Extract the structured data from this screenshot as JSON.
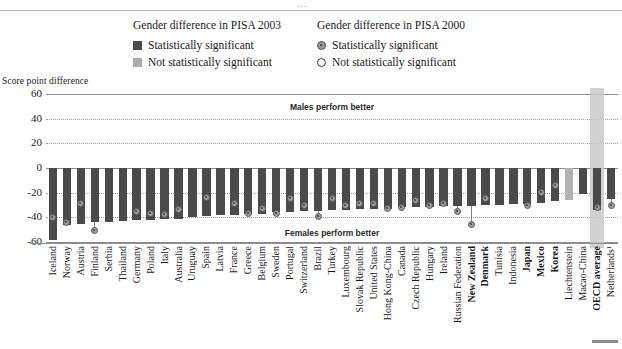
{
  "page": {
    "top_glyph": "…"
  },
  "legend": {
    "columns": [
      {
        "title": "Gender difference in PISA 2003",
        "items": [
          {
            "marker": "dark-square-swatch",
            "label": "Statistically significant"
          },
          {
            "marker": "light-square-swatch",
            "label": "Not statistically significant"
          }
        ]
      },
      {
        "title": "Gender difference in PISA 2000",
        "items": [
          {
            "marker": "filled-circle-marker",
            "label": "Statistically significant"
          },
          {
            "marker": "open-circle-marker",
            "label": "Not statistically significant"
          }
        ]
      }
    ]
  },
  "axis_title": "Score point difference",
  "annotations": {
    "males": "Males perform better",
    "females": "Females perform better"
  },
  "colors": {
    "bar_significant": "#4a4a4a",
    "bar_not_significant": "#b2b2b2",
    "marker_fill": "#9d9d9d",
    "marker_stroke": "#5a5a5a",
    "gridline": "#9d9d9d",
    "axis": "#8c8c8c",
    "highlight_band": "#c9c9c9"
  },
  "chart_data": {
    "type": "bar",
    "title": "",
    "subtitle": "",
    "xlabel": "",
    "ylabel": "Score point difference",
    "ylim": [
      -60,
      60
    ],
    "yticks": [
      60,
      40,
      20,
      0,
      -20,
      -40,
      -60
    ],
    "grid": true,
    "legend_position": "top",
    "highlighted_category": "OECD average",
    "categories": [
      "Iceland",
      "Norway",
      "Austria",
      "Finland",
      "Serbia",
      "Thailand",
      "Germany",
      "Poland",
      "Italy",
      "Australia",
      "Uruguay",
      "Spain",
      "Latvia",
      "France",
      "Greece",
      "Belgium",
      "Sweden",
      "Portugal",
      "Switzerland",
      "Brazil",
      "Turkey",
      "Luxembourg",
      "Slovak Republic",
      "United States",
      "Hong Kong-China",
      "Canada",
      "Czech Republic",
      "Hungary",
      "Ireland",
      "Russian Federation",
      "New Zealand",
      "Denmark",
      "Tunisia",
      "Indonesia",
      "Japan",
      "Mexico",
      "Korea",
      "Liechtenstein",
      "Macao-China",
      "OECD average",
      "Netherlands¹"
    ],
    "series": [
      {
        "name": "Gender difference in PISA 2003",
        "type": "bar",
        "values": [
          -58,
          -46,
          -45,
          -44,
          -44,
          -43,
          -42,
          -42,
          -41,
          -41,
          -40,
          -39,
          -38,
          -38,
          -37,
          -37,
          -36,
          -36,
          -35,
          -35,
          -34,
          -34,
          -33,
          -33,
          -33,
          -32,
          -32,
          -32,
          -31,
          -31,
          -31,
          -30,
          -30,
          -29,
          -29,
          -28,
          -27,
          -26,
          -21,
          -34,
          -25
        ],
        "significance": [
          "significant",
          "significant",
          "significant",
          "significant",
          "significant",
          "significant",
          "significant",
          "significant",
          "significant",
          "significant",
          "significant",
          "significant",
          "significant",
          "significant",
          "significant",
          "significant",
          "significant",
          "significant",
          "significant",
          "significant",
          "significant",
          "significant",
          "significant",
          "significant",
          "significant",
          "significant",
          "significant",
          "significant",
          "significant",
          "significant",
          "significant",
          "significant",
          "significant",
          "significant",
          "significant",
          "significant",
          "significant",
          "not significant",
          "significant",
          "significant",
          "significant"
        ]
      },
      {
        "name": "Gender difference in PISA 2000",
        "type": "scatter",
        "values": [
          -40,
          -44,
          -29,
          -51,
          null,
          null,
          -35,
          -37,
          -38,
          -34,
          null,
          -24,
          null,
          -29,
          -37,
          -33,
          -37,
          -25,
          -30,
          -39,
          -25,
          -30,
          -29,
          -29,
          -33,
          -32,
          -26,
          -30,
          -29,
          -35,
          -46,
          -25,
          null,
          null,
          -30,
          -20,
          -14,
          null,
          null,
          -32,
          -30
        ],
        "significance": [
          "significant",
          "significant",
          "significant",
          "significant",
          null,
          null,
          "significant",
          "significant",
          "significant",
          "significant",
          null,
          "significant",
          null,
          "significant",
          "significant",
          "significant",
          "significant",
          "significant",
          "significant",
          "significant",
          "significant",
          "significant",
          "significant",
          "significant",
          "significant",
          "significant",
          "significant",
          "significant",
          "significant",
          "significant",
          "significant",
          "significant",
          null,
          null,
          "significant",
          "significant",
          "significant",
          null,
          null,
          "significant",
          "significant"
        ]
      }
    ]
  }
}
